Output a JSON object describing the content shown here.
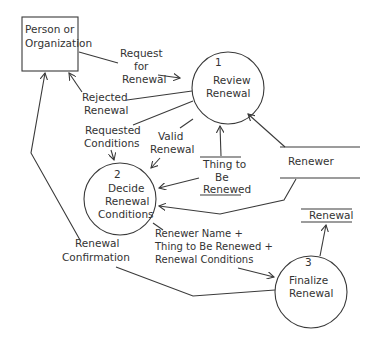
{
  "diagram": {
    "type": "data-flow-diagram",
    "external_entities": [
      {
        "id": "person",
        "lines": [
          "Person or",
          "Organization"
        ]
      }
    ],
    "processes": [
      {
        "id": "p1",
        "number": "1",
        "lines": [
          "Review",
          "Renewal"
        ]
      },
      {
        "id": "p2",
        "number": "2",
        "lines": [
          "Decide",
          "Renewal",
          "Conditions"
        ]
      },
      {
        "id": "p3",
        "number": "3",
        "lines": [
          "Finalize",
          "Renewal"
        ]
      }
    ],
    "data_stores": [
      {
        "id": "thing",
        "lines": [
          "Thing to",
          "Be",
          "Renewed"
        ]
      },
      {
        "id": "renewer",
        "lines": [
          "Renewer"
        ]
      },
      {
        "id": "renewal",
        "lines": [
          "Renewal"
        ]
      }
    ],
    "flows": [
      {
        "id": "request",
        "lines": [
          "Request",
          "for",
          "Renewal"
        ],
        "from": "person",
        "to": "p1"
      },
      {
        "id": "rejected",
        "lines": [
          "Rejected",
          "Renewal"
        ],
        "from": "p1",
        "to": "person"
      },
      {
        "id": "requested_conditions",
        "lines": [
          "Requested",
          "Conditions"
        ],
        "from": "p1",
        "to": "p2"
      },
      {
        "id": "valid",
        "lines": [
          "Valid",
          "Renewal"
        ],
        "from": "p1",
        "to": "p2"
      },
      {
        "id": "thing_to_p1",
        "lines": [],
        "from": "thing",
        "to": "p1"
      },
      {
        "id": "thing_to_p2",
        "lines": [],
        "from": "thing",
        "to": "p2"
      },
      {
        "id": "renewer_to_p1",
        "lines": [],
        "from": "renewer",
        "to": "p1"
      },
      {
        "id": "renewer_to_p2",
        "lines": [],
        "from": "renewer",
        "to": "p2"
      },
      {
        "id": "combined",
        "lines": [
          "Renewer Name +",
          "Thing to Be Renewed +",
          "Renewal Conditions"
        ],
        "from": "p2",
        "to": "p3"
      },
      {
        "id": "p3_to_renewal",
        "lines": [],
        "from": "p3",
        "to": "renewal"
      },
      {
        "id": "confirmation",
        "lines": [
          "Renewal",
          "Confirmation"
        ],
        "from": "p3",
        "to": "person"
      }
    ]
  }
}
